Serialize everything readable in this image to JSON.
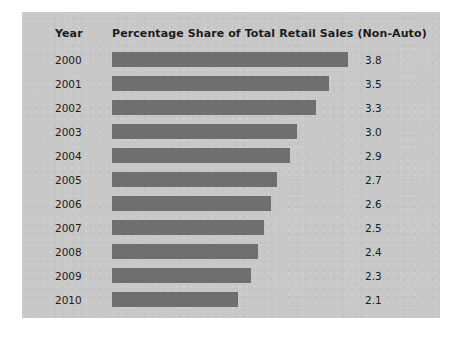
{
  "figure": {
    "panel_background": "#c8c8c8",
    "page_background": "#ffffff",
    "bar_color": "#6f6f6f",
    "text_color": "#1c1c1c"
  },
  "table": {
    "header": {
      "year_label": "Year",
      "metric_label": "Percentage Share of Total Retail Sales (Non-Auto)"
    }
  },
  "chart_data": {
    "type": "bar",
    "orientation": "horizontal",
    "title": "Percentage Share of Total Retail Sales (Non-Auto)",
    "xlabel": "Percentage Share of Total Retail Sales (Non-Auto)",
    "ylabel": "Year",
    "categories": [
      "2000",
      "2001",
      "2002",
      "2003",
      "2004",
      "2005",
      "2006",
      "2007",
      "2008",
      "2009",
      "2010"
    ],
    "values": [
      3.8,
      3.5,
      3.3,
      3.0,
      2.9,
      2.7,
      2.6,
      2.5,
      2.4,
      2.3,
      2.1
    ],
    "value_labels": [
      "3.8",
      "3.5",
      "3.3",
      "3.0",
      "2.9",
      "2.7",
      "2.6",
      "2.5",
      "2.4",
      "2.3",
      "2.1"
    ],
    "units": "percent",
    "grid": false,
    "legend": false,
    "xlim": [
      0,
      3.8
    ],
    "bar_pixel_lengths": [
      236,
      217,
      204,
      185,
      178,
      165,
      159,
      152,
      146,
      139,
      126
    ]
  }
}
